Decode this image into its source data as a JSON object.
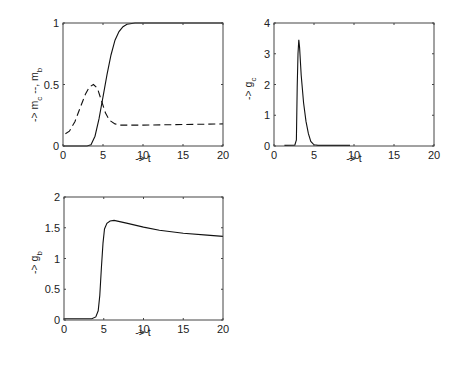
{
  "chart_data": [
    {
      "type": "line",
      "panel": "top-left",
      "title": "",
      "xlabel": "-> t",
      "ylabel": "-> m_c --, m_b",
      "xlim": [
        0,
        20
      ],
      "ylim": [
        0,
        1
      ],
      "xticks": [
        0,
        5,
        10,
        15,
        20
      ],
      "yticks": [
        0,
        0.5,
        1
      ],
      "ytick_labels": [
        "0",
        "0.5",
        "1"
      ],
      "grid": false,
      "legend": null,
      "series": [
        {
          "name": "m_b",
          "style": "solid",
          "x": [
            0,
            3.0,
            3.5,
            4.0,
            4.5,
            5.0,
            5.5,
            6.0,
            6.5,
            7.0,
            7.5,
            8.0,
            9.0,
            10.0,
            20.0
          ],
          "y": [
            0,
            0,
            0.01,
            0.08,
            0.22,
            0.4,
            0.58,
            0.74,
            0.86,
            0.93,
            0.97,
            0.99,
            1.0,
            1.0,
            1.0
          ]
        },
        {
          "name": "m_c",
          "style": "dashed",
          "x": [
            0.3,
            0.8,
            1.5,
            2.2,
            2.8,
            3.3,
            3.8,
            4.3,
            4.8,
            5.3,
            5.8,
            6.5,
            7.0,
            8.0,
            10.0,
            20.0
          ],
          "y": [
            0.1,
            0.12,
            0.2,
            0.32,
            0.42,
            0.48,
            0.5,
            0.47,
            0.37,
            0.27,
            0.21,
            0.18,
            0.17,
            0.17,
            0.17,
            0.18
          ]
        }
      ]
    },
    {
      "type": "line",
      "panel": "top-right",
      "title": "",
      "xlabel": "-> t",
      "ylabel": "-> g_c",
      "xlim": [
        0,
        20
      ],
      "ylim": [
        0,
        4
      ],
      "xticks": [
        0,
        5,
        10,
        15,
        20
      ],
      "yticks": [
        0,
        1,
        2,
        3,
        4
      ],
      "ytick_labels": [
        "0",
        "1",
        "2",
        "3",
        "4"
      ],
      "grid": false,
      "legend": null,
      "series": [
        {
          "name": "g_c",
          "style": "solid",
          "x": [
            1.3,
            2.6,
            2.8,
            2.9,
            3.0,
            3.1,
            3.2,
            3.4,
            3.7,
            4.0,
            4.3,
            4.6,
            5.0,
            5.5,
            9.5
          ],
          "y": [
            0.02,
            0.03,
            0.2,
            1.9,
            3.0,
            3.45,
            3.2,
            2.3,
            1.4,
            0.8,
            0.4,
            0.15,
            0.04,
            0.02,
            0.02
          ]
        }
      ]
    },
    {
      "type": "line",
      "panel": "bottom-left",
      "title": "",
      "xlabel": "-> t",
      "ylabel": "-> g_b",
      "xlim": [
        0,
        20
      ],
      "ylim": [
        0,
        2
      ],
      "xticks": [
        0,
        5,
        10,
        15,
        20
      ],
      "yticks": [
        0,
        0.5,
        1,
        1.5,
        2
      ],
      "ytick_labels": [
        "0",
        "0.5",
        "1",
        "1.5",
        "2"
      ],
      "grid": false,
      "legend": null,
      "series": [
        {
          "name": "g_b",
          "style": "solid",
          "x": [
            0,
            3.5,
            4.0,
            4.3,
            4.5,
            4.7,
            4.9,
            5.1,
            5.4,
            5.8,
            6.3,
            7.0,
            8.0,
            10.0,
            12.0,
            15.0,
            18.0,
            20.0
          ],
          "y": [
            0.02,
            0.02,
            0.05,
            0.15,
            0.4,
            0.85,
            1.25,
            1.48,
            1.57,
            1.61,
            1.62,
            1.6,
            1.57,
            1.51,
            1.46,
            1.41,
            1.38,
            1.36
          ]
        }
      ]
    }
  ],
  "panels": {
    "tl": {
      "xlabel": "-> t",
      "ylabel_main": "-> m",
      "ylabel_sub1": "c",
      "ylabel_mid": " --, m",
      "ylabel_sub2": "b"
    },
    "tr": {
      "xlabel": "-> t",
      "ylabel_main": "-> g",
      "ylabel_sub": "c"
    },
    "bl": {
      "xlabel": "-> t",
      "ylabel_main": "-> g",
      "ylabel_sub": "b"
    }
  }
}
